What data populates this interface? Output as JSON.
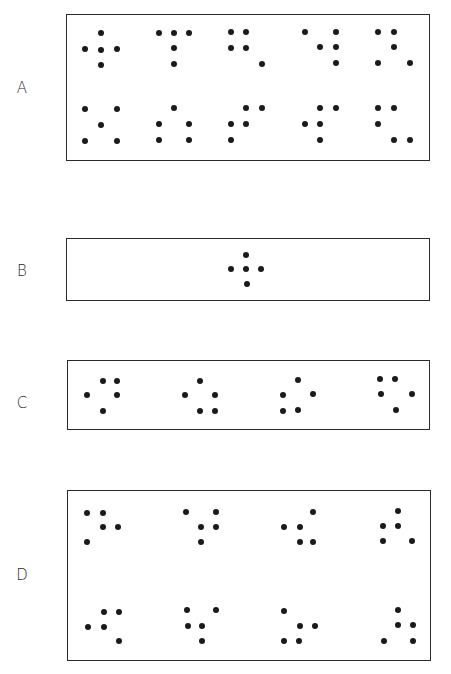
{
  "figure": {
    "panels": [
      {
        "id": "A",
        "label": "A",
        "label_pos": [
          22,
          88
        ],
        "box": [
          66,
          14,
          430,
          161
        ],
        "patterns": [
          [
            [
              101,
              33
            ],
            [
              85,
              49
            ],
            [
              101,
              50
            ],
            [
              117,
              49
            ],
            [
              101,
              65
            ]
          ],
          [
            [
              159,
              33
            ],
            [
              174,
              33
            ],
            [
              189,
              33
            ],
            [
              174,
              48
            ],
            [
              174,
              64
            ]
          ],
          [
            [
              231,
              32
            ],
            [
              246,
              32
            ],
            [
              231,
              48
            ],
            [
              246,
              48
            ],
            [
              262,
              64
            ]
          ],
          [
            [
              305,
              32
            ],
            [
              336,
              32
            ],
            [
              320,
              47
            ],
            [
              336,
              47
            ],
            [
              336,
              63
            ]
          ],
          [
            [
              378,
              32
            ],
            [
              394,
              32
            ],
            [
              394,
              47
            ],
            [
              378,
              63
            ],
            [
              410,
              63
            ]
          ],
          [
            [
              85,
              109
            ],
            [
              117,
              109
            ],
            [
              101,
              125
            ],
            [
              85,
              141
            ],
            [
              117,
              141
            ]
          ],
          [
            [
              174,
              108
            ],
            [
              159,
              124
            ],
            [
              189,
              124
            ],
            [
              159,
              140
            ],
            [
              189,
              140
            ]
          ],
          [
            [
              246,
              108
            ],
            [
              262,
              108
            ],
            [
              231,
              124
            ],
            [
              246,
              124
            ],
            [
              231,
              140
            ]
          ],
          [
            [
              320,
              108
            ],
            [
              336,
              108
            ],
            [
              305,
              124
            ],
            [
              320,
              124
            ],
            [
              320,
              140
            ]
          ],
          [
            [
              378,
              108
            ],
            [
              394,
              108
            ],
            [
              378,
              124
            ],
            [
              394,
              140
            ],
            [
              410,
              140
            ]
          ]
        ]
      },
      {
        "id": "B",
        "label": "B",
        "label_pos": [
          22,
          271
        ],
        "box": [
          66,
          238,
          430,
          301
        ],
        "patterns": [
          [
            [
              246,
              255
            ],
            [
              231,
              269
            ],
            [
              246,
              269
            ],
            [
              261,
              269
            ],
            [
              247,
              284
            ]
          ]
        ]
      },
      {
        "id": "C",
        "label": "C",
        "label_pos": [
          22,
          403
        ],
        "box": [
          67,
          360,
          430,
          430
        ],
        "patterns": [
          [
            [
              103,
              381
            ],
            [
              117,
              381
            ],
            [
              87,
              395
            ],
            [
              117,
              395
            ],
            [
              103,
              411
            ]
          ],
          [
            [
              200,
              381
            ],
            [
              185,
              395
            ],
            [
              215,
              395
            ],
            [
              200,
              411
            ],
            [
              215,
              411
            ]
          ],
          [
            [
              298,
              380
            ],
            [
              283,
              395
            ],
            [
              313,
              394
            ],
            [
              283,
              411
            ],
            [
              298,
              410
            ]
          ],
          [
            [
              380,
              379
            ],
            [
              395,
              379
            ],
            [
              381,
              394
            ],
            [
              412,
              394
            ],
            [
              396,
              410
            ]
          ]
        ]
      },
      {
        "id": "D",
        "label": "D",
        "label_pos": [
          22,
          575
        ],
        "box": [
          67,
          490,
          431,
          661
        ],
        "patterns": [
          [
            [
              87,
              513
            ],
            [
              103,
              513
            ],
            [
              103,
              527
            ],
            [
              118,
              527
            ],
            [
              87,
              542
            ]
          ],
          [
            [
              186,
              512
            ],
            [
              216,
              512
            ],
            [
              201,
              527
            ],
            [
              216,
              527
            ],
            [
              201,
              542
            ]
          ],
          [
            [
              313,
              512
            ],
            [
              284,
              527
            ],
            [
              300,
              527
            ],
            [
              300,
              542
            ],
            [
              313,
              542
            ]
          ],
          [
            [
              398,
              511
            ],
            [
              383,
              526
            ],
            [
              398,
              526
            ],
            [
              383,
              541
            ],
            [
              412,
              541
            ]
          ],
          [
            [
              104,
              612
            ],
            [
              119,
              612
            ],
            [
              88,
              627
            ],
            [
              104,
              627
            ],
            [
              119,
              641
            ]
          ],
          [
            [
              187,
              610
            ],
            [
              216,
              610
            ],
            [
              188,
              626
            ],
            [
              202,
              626
            ],
            [
              202,
              641
            ]
          ],
          [
            [
              284,
              611
            ],
            [
              300,
              626
            ],
            [
              315,
              626
            ],
            [
              284,
              641
            ],
            [
              299,
              641
            ]
          ],
          [
            [
              398,
              610
            ],
            [
              398,
              625
            ],
            [
              413,
              625
            ],
            [
              384,
              641
            ],
            [
              413,
              641
            ]
          ]
        ]
      }
    ],
    "colors": {
      "dot": "#1a1a1a",
      "frame": "#2a2a2a",
      "label": "#2a2a2a",
      "background": "#ffffff"
    }
  }
}
